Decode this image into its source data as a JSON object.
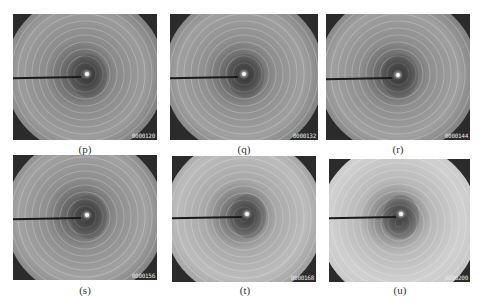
{
  "figure": {
    "panels": [
      {
        "id": "p",
        "caption": "(p)",
        "counter": "0000120",
        "brightness": "medium"
      },
      {
        "id": "q",
        "caption": "(q)",
        "counter": "0000132",
        "brightness": "medium"
      },
      {
        "id": "r",
        "caption": "(r)",
        "counter": "0000144",
        "brightness": "medium"
      },
      {
        "id": "s",
        "caption": "(s)",
        "counter": "0000156",
        "brightness": "medium"
      },
      {
        "id": "t",
        "caption": "(t)",
        "counter": "0000168",
        "brightness": "bright"
      },
      {
        "id": "u",
        "caption": "(u)",
        "counter": "0000200",
        "brightness": "brightest"
      }
    ],
    "colors": {
      "background": "#ffffff",
      "panel_dark": "#2b2b2b",
      "caption_text": "#333333"
    }
  }
}
